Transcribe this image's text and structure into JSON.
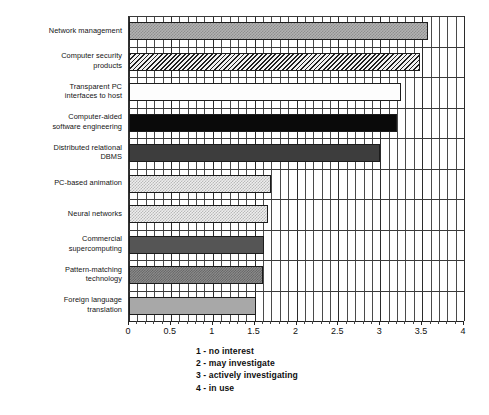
{
  "chart_data": {
    "type": "bar",
    "orientation": "horizontal",
    "title": "",
    "xlabel": "",
    "ylabel": "",
    "xlim": [
      0,
      4
    ],
    "grid": true,
    "grid_minor_step": 0.1,
    "grid_major_step": 0.5,
    "legend_position": "below-axis",
    "categories": [
      "Network management",
      "Computer security products",
      "Transparent PC interfaces to host",
      "Computer-aided software engineering",
      "Distributed relational DBMS",
      "PC-based animation",
      "Neural networks",
      "Commercial supercomputing",
      "Pattern-matching technology",
      "Foreign language translation"
    ],
    "values": [
      3.57,
      3.47,
      3.25,
      3.2,
      3.0,
      1.7,
      1.66,
      1.61,
      1.6,
      1.52
    ],
    "tick_labels": [
      "0",
      "0.5",
      "1",
      "1.5",
      "2",
      "2.5",
      "3",
      "3.5",
      "4"
    ],
    "tick_values": [
      0,
      0.5,
      1,
      1.5,
      2,
      2.5,
      3,
      3.5,
      4
    ],
    "annotations": [
      "1 - no interest",
      "2 - may investigate",
      "3 - actively investigating",
      "4 - in use"
    ]
  },
  "categories_display": [
    {
      "lines": [
        "Network management"
      ],
      "value": 3.57,
      "pattern": "fill-checker-light"
    },
    {
      "lines": [
        "Computer security",
        "products"
      ],
      "value": 3.47,
      "pattern": "fill-diag-hatch"
    },
    {
      "lines": [
        "Transparent PC",
        "interfaces to host"
      ],
      "value": 3.25,
      "pattern": "fill-white"
    },
    {
      "lines": [
        "Computer-aided",
        "software engineering"
      ],
      "value": 3.2,
      "pattern": "fill-black"
    },
    {
      "lines": [
        "Distributed relational",
        "DBMS"
      ],
      "value": 3.0,
      "pattern": "fill-darkgray"
    },
    {
      "lines": [
        "PC-based animation"
      ],
      "value": 1.7,
      "pattern": "fill-dot-pale"
    },
    {
      "lines": [
        "Neural networks"
      ],
      "value": 1.66,
      "pattern": "fill-dot-pale"
    },
    {
      "lines": [
        "Commercial",
        "supercomputing"
      ],
      "value": 1.61,
      "pattern": "fill-gray-solid"
    },
    {
      "lines": [
        "Pattern-matching",
        "technology"
      ],
      "value": 1.6,
      "pattern": "fill-checker-mid"
    },
    {
      "lines": [
        "Foreign language",
        "translation"
      ],
      "value": 1.52,
      "pattern": "fill-lightgray-solid"
    }
  ],
  "legend": {
    "lines": [
      "1 - no interest",
      "2 - may investigate",
      "3 - actively investigating",
      "4 - in use"
    ]
  },
  "colors": {
    "axis": "#222222",
    "grid_minor": "#4a4a4a",
    "grid_major": "#2b2b2b",
    "bar_outline": "#1c1c1c",
    "text": "#141414"
  }
}
